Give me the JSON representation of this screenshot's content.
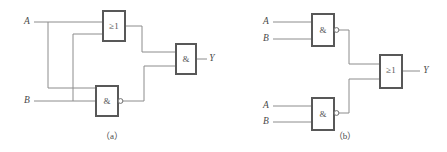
{
  "figure": {
    "background_color": "#ffffff",
    "wire_color": "#8c8c8c",
    "gate_border_color": "#585858",
    "text_color": "#4a4a4a",
    "width": 447,
    "height": 152
  },
  "captions": {
    "left": "（a）",
    "right": "（b）"
  },
  "circuit_a": {
    "name": "circuit-a",
    "inputs": [
      {
        "label": "A",
        "x": 27,
        "y": 22
      },
      {
        "label": "B",
        "x": 27,
        "y": 101
      }
    ],
    "output": {
      "label": "Y",
      "x": 212,
      "y": 60
    },
    "gates": [
      {
        "id": "or1",
        "symbol": "≥1",
        "type": "or",
        "inverted": false,
        "x": 103,
        "y": 11,
        "w": 22,
        "h": 30
      },
      {
        "id": "nand1",
        "symbol": "&",
        "type": "nand",
        "inverted": true,
        "x": 96,
        "y": 86,
        "w": 22,
        "h": 30
      },
      {
        "id": "and1",
        "symbol": "&",
        "type": "and",
        "inverted": false,
        "x": 176,
        "y": 44,
        "w": 20,
        "h": 30
      }
    ]
  },
  "circuit_b": {
    "name": "circuit-b",
    "inputs": [
      {
        "label": "A",
        "x": 266,
        "y": 22
      },
      {
        "label": "B",
        "x": 266,
        "y": 39
      },
      {
        "label": "A",
        "x": 266,
        "y": 106
      },
      {
        "label": "B",
        "x": 266,
        "y": 122
      }
    ],
    "output": {
      "label": "Y",
      "x": 426,
      "y": 71
    },
    "gates": [
      {
        "id": "nand_top",
        "symbol": "&",
        "type": "nand",
        "inverted": true,
        "x": 312,
        "y": 14,
        "w": 22,
        "h": 32
      },
      {
        "id": "nand_bottom",
        "symbol": "&",
        "type": "nand",
        "inverted": true,
        "x": 312,
        "y": 98,
        "w": 22,
        "h": 32
      },
      {
        "id": "or_out",
        "symbol": "≥1",
        "type": "or",
        "inverted": false,
        "x": 380,
        "y": 55,
        "w": 22,
        "h": 33
      }
    ]
  }
}
